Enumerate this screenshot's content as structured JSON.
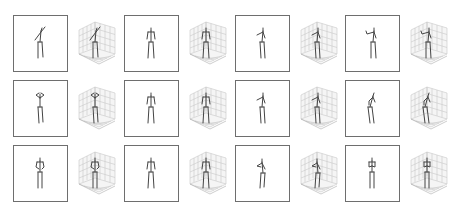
{
  "figure": {
    "layout": {
      "rows": 3,
      "groups_per_row": 4
    },
    "colors": {
      "box_border": "#6e6e6e",
      "skeleton": "#444444",
      "grid": "#c8c8c8",
      "pane": "#efefef"
    },
    "panels": [
      {
        "row": 0,
        "group": 0,
        "pose": "arm-raised-diagonal"
      },
      {
        "row": 0,
        "group": 1,
        "pose": "standing-neutral"
      },
      {
        "row": 0,
        "group": 2,
        "pose": "arm-forward-left"
      },
      {
        "row": 0,
        "group": 3,
        "pose": "arm-forward-raised"
      },
      {
        "row": 1,
        "group": 0,
        "pose": "hands-to-head"
      },
      {
        "row": 1,
        "group": 1,
        "pose": "standing-neutral"
      },
      {
        "row": 1,
        "group": 2,
        "pose": "arm-forward-left"
      },
      {
        "row": 1,
        "group": 3,
        "pose": "leaning-side"
      },
      {
        "row": 2,
        "group": 0,
        "pose": "arms-bent"
      },
      {
        "row": 2,
        "group": 1,
        "pose": "standing-neutral"
      },
      {
        "row": 2,
        "group": 2,
        "pose": "crouched-arm-forward"
      },
      {
        "row": 2,
        "group": 3,
        "pose": "hands-to-chest"
      }
    ]
  }
}
